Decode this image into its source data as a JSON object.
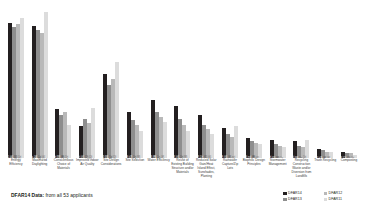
{
  "caption": {
    "strong": "DFAR14 Data:",
    "rest": " from all 53 applicants"
  },
  "legend": {
    "position": "bottom-right",
    "items": [
      {
        "label": "DFAR14",
        "color": "#231f20"
      },
      {
        "label": "DFAR12",
        "color": "#b9b9b9"
      },
      {
        "label": "DFAR13",
        "color": "#8e8e8e"
      },
      {
        "label": "DFAR11",
        "color": "#dcdcdc"
      }
    ]
  },
  "chart_data": {
    "type": "bar",
    "title": "",
    "xlabel": "",
    "ylabel": "",
    "ylim": [
      0,
      100
    ],
    "grid": false,
    "categories": [
      "Energy Efficiency",
      "Maximized Daylighting",
      "Conscientious Choice of Materials",
      "Improved Indoor Air Quality",
      "Site Design Considerations",
      "Site Selection",
      "Water Efficiency",
      "Reuse of Existing Building Structure and/or Materials",
      "Reduced Solar Gain/Heat Island Effect, Sunshades, Planting",
      "Rainwater Capture/Zip Lots",
      "Biophilic Design Principles",
      "Stormwater Management",
      "Recycling Construction Waste and/or Diversion from Landfills",
      "Trash Recycling",
      "Composting"
    ],
    "series": [
      {
        "name": "DFAR14",
        "color": "#231f20",
        "values": [
          89,
          87,
          32,
          21,
          55,
          30,
          38,
          34,
          28,
          20,
          13,
          12,
          11,
          6,
          4
        ],
        "labels": [
          "89",
          "87",
          "32",
          "21",
          "55",
          "30",
          "38",
          "34",
          "28",
          "20",
          "13",
          "12",
          "11",
          "6",
          "4"
        ]
      },
      {
        "name": "DFAR13",
        "color": "#8e8e8e",
        "values": [
          86,
          84,
          28,
          26,
          48,
          25,
          30,
          26,
          22,
          16,
          11,
          9,
          8,
          5,
          3
        ],
        "labels": [
          "86",
          "84",
          "28",
          "26",
          "48",
          "25",
          "30",
          "26",
          "22",
          "16",
          "11",
          "9",
          "8",
          "5",
          "3"
        ]
      },
      {
        "name": "DFAR12",
        "color": "#b9b9b9",
        "values": [
          88,
          82,
          30,
          23,
          52,
          22,
          27,
          22,
          19,
          14,
          10,
          8,
          7,
          4,
          3
        ],
        "labels": [
          "88",
          "82",
          "30",
          "23",
          "52",
          "22",
          "27",
          "22",
          "19",
          "14",
          "10",
          "8",
          "7",
          "4",
          "3"
        ]
      },
      {
        "name": "DFAR11",
        "color": "#dcdcdc",
        "values": [
          92,
          96,
          22,
          33,
          63,
          18,
          24,
          18,
          16,
          21,
          9,
          7,
          12,
          4,
          2
        ],
        "labels": [
          "92",
          "96",
          "22",
          "33",
          "63",
          "18",
          "24",
          "18",
          "16",
          "21",
          "9",
          "7",
          "12",
          "4",
          "2"
        ]
      }
    ]
  }
}
